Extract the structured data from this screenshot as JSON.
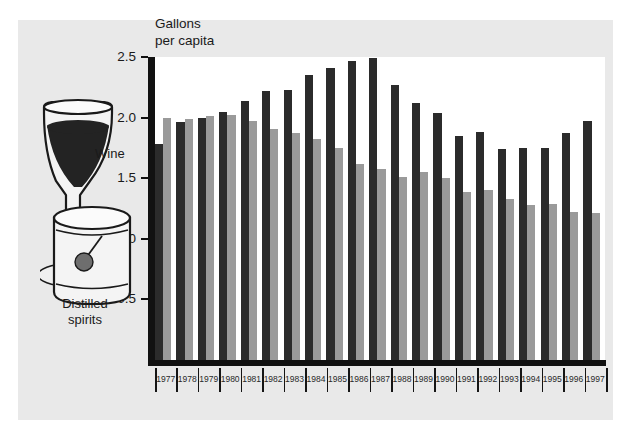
{
  "chart_data": {
    "type": "bar",
    "title": "",
    "axis_title_lines": [
      "Gallons",
      "per capita"
    ],
    "xlabel": "",
    "ylabel": "Gallons per capita",
    "ylim": [
      0,
      2.5
    ],
    "yticks": [
      0.5,
      1.0,
      1.5,
      2.0,
      2.5
    ],
    "ytick_labels": [
      "0.5",
      "1.0",
      "1.5",
      "2.0",
      "2.5"
    ],
    "grid": false,
    "legend_position": "left-illustration",
    "categories": [
      "1977",
      "1978",
      "1979",
      "1980",
      "1981",
      "1982",
      "1983",
      "1984",
      "1985",
      "1986",
      "1987",
      "1988",
      "1989",
      "1990",
      "1991",
      "1992",
      "1993",
      "1994",
      "1995",
      "1996",
      "1997"
    ],
    "series": [
      {
        "name": "Distilled spirits",
        "color": "#2b2b2b",
        "values": [
          1.78,
          1.96,
          2.0,
          2.05,
          2.14,
          2.22,
          2.23,
          2.35,
          2.41,
          2.47,
          2.49,
          2.27,
          2.12,
          2.04,
          1.85,
          1.88,
          1.74,
          1.75,
          1.75,
          1.87,
          1.97
        ]
      },
      {
        "name": "Wine",
        "color": "#9a9a9a",
        "values": [
          2.0,
          1.99,
          2.01,
          2.02,
          1.97,
          1.91,
          1.87,
          1.82,
          1.75,
          1.62,
          1.58,
          1.51,
          1.55,
          1.5,
          1.39,
          1.4,
          1.33,
          1.28,
          1.29,
          1.22,
          1.21
        ]
      }
    ]
  },
  "illustration": {
    "wine_label": "Wine",
    "spirits_label_line1": "Distilled",
    "spirits_label_line2": "spirits",
    "wine_glass_icon": "wine-glass-icon",
    "tumbler_icon": "tumbler-glass-icon"
  },
  "colors": {
    "panel_background": "#e9e9e9",
    "plot_background": "#ffffff",
    "axis": "#111111",
    "spirits_bar": "#2b2b2b",
    "wine_bar": "#9a9a9a",
    "text": "#1a1a1a"
  }
}
